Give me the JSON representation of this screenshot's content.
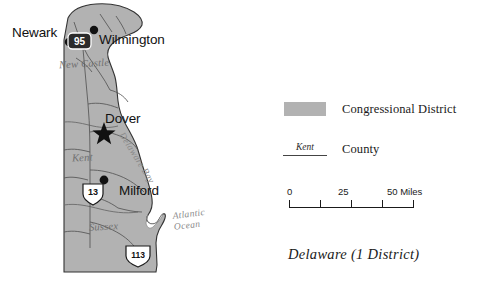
{
  "figure": {
    "caption": "Delaware (1 District)"
  },
  "map": {
    "cities": [
      {
        "name": "Newark",
        "marker": "dot"
      },
      {
        "name": "Wilmington",
        "marker": "dot"
      },
      {
        "name": "Dover",
        "marker": "star"
      },
      {
        "name": "Milford",
        "marker": "dot"
      }
    ],
    "counties": [
      {
        "name": "New Castle"
      },
      {
        "name": "Kent"
      },
      {
        "name": "Sussex"
      }
    ],
    "water_bodies": [
      {
        "name": "Delaware Bay"
      },
      {
        "name": "Atlantic Ocean",
        "line1": "Atlantic",
        "line2": "Ocean"
      }
    ],
    "highways": [
      {
        "number": "95",
        "type": "interstate"
      },
      {
        "number": "13",
        "type": "us-route"
      },
      {
        "number": "113",
        "type": "us-route"
      }
    ],
    "colors": {
      "district_fill": "#b2b2b2",
      "state_outline": "#333333",
      "county_line": "#6b6b6b",
      "road_line": "#555555",
      "water": "#ffffff"
    }
  },
  "legend": {
    "district": {
      "label": "Congressional District"
    },
    "county": {
      "sample": "Kent",
      "label": "County"
    }
  },
  "scale": {
    "unit_label": "50 Miles",
    "ticks": [
      "0",
      "25",
      "50 Miles"
    ],
    "tick_0": "0",
    "tick_25": "25",
    "tick_50": "50 Miles"
  }
}
